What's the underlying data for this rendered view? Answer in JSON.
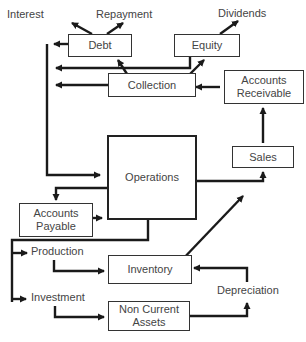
{
  "diagram": {
    "nodes": {
      "debt": "Debt",
      "equity": "Equity",
      "collection": "Collection",
      "accounts_receivable": "Accounts\nReceivable",
      "sales": "Sales",
      "operations": "Operations",
      "accounts_payable": "Accounts\nPayable",
      "inventory": "Inventory",
      "non_current_assets": "Non Current\nAssets"
    },
    "labels": {
      "interest": "Interest",
      "repayment": "Repayment",
      "dividends": "Dividends",
      "production": "Production",
      "investment": "Investment",
      "depreciation": "Depreciation"
    },
    "colors": {
      "line": "#1a1a1a",
      "text": "#444444",
      "border": "#333333"
    }
  }
}
